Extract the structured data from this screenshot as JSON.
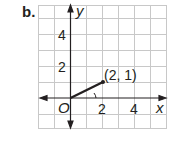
{
  "part_label": "b.",
  "axes": {
    "x_label": "x",
    "y_label": "y",
    "origin_label": "O",
    "x_ticks": [
      "2",
      "4"
    ],
    "y_ticks": [
      "2",
      "4"
    ]
  },
  "point": {
    "label": "(2, 1)",
    "x": 2,
    "y": 1
  },
  "grid": {
    "x_min": -2,
    "x_max": 6,
    "y_min": -2,
    "y_max": 6,
    "line_color": "#c8c8c8",
    "axis_color": "#231f20"
  }
}
